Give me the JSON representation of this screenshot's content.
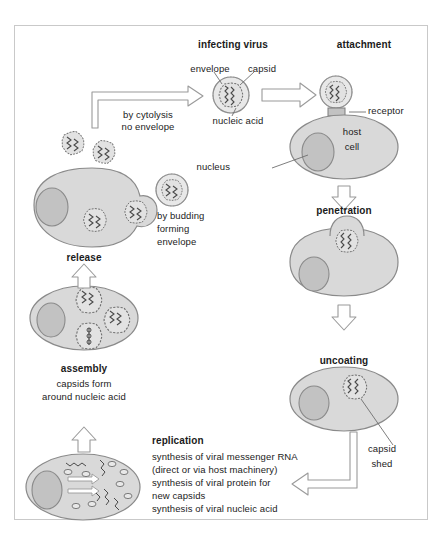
{
  "diagram": {
    "colors": {
      "cell_fill": "#d9d9d9",
      "cell_stroke": "#8a8a8a",
      "nucleus_fill": "#c2c2c2",
      "nucleus_stroke": "#8a8a8a",
      "capsid_fill": "#e2e2e2",
      "capsid_stroke": "#6f6f6f",
      "envelope_fill": "#e8e8e8",
      "envelope_stroke": "#8a8a8a",
      "arrow_fill": "#ffffff",
      "arrow_stroke": "#9a9a9a",
      "leader_stroke": "#6f6f6f",
      "frame_stroke": "#c9c9c9",
      "text": "#1b1b1b"
    },
    "stage_labels": {
      "infecting_virus": "infecting virus",
      "attachment": "attachment",
      "penetration": "penetration",
      "uncoating": "uncoating",
      "replication": "replication",
      "assembly": "assembly",
      "release": "release"
    },
    "part_labels": {
      "envelope": "envelope",
      "capsid": "capsid",
      "nucleic_acid": "nucleic acid",
      "receptor": "receptor",
      "nucleus": "nucleus",
      "host": "host",
      "cell": "cell",
      "capsid_shed_line1": "capsid",
      "capsid_shed_line2": "shed"
    },
    "annotations": {
      "cytolysis_line1": "by cytolysis",
      "cytolysis_line2": "no envelope",
      "budding_line1": "by budding",
      "budding_line2": "forming",
      "budding_line3": "envelope",
      "assembly_line1": "capsids form",
      "assembly_line2": "around nucleic acid",
      "replication_line1": "synthesis of viral messenger RNA",
      "replication_line2": "(direct or via host machinery)",
      "replication_line3": "synthesis of viral protein for",
      "replication_line4": "new capsids",
      "replication_line5": "synthesis of viral nucleic acid"
    }
  }
}
